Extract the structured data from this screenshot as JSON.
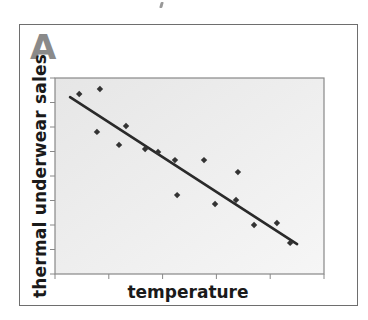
{
  "figure": {
    "panel_label": "A",
    "colors": {
      "frame": "#6e6e6e",
      "plot_bg": "#ececec",
      "axis": "#888888",
      "points": "#333333",
      "trendline": "#2a2a2a",
      "panel_label": "#8a8a8a"
    }
  },
  "chart_data": {
    "type": "scatter",
    "title": "",
    "xlabel": "temperature",
    "ylabel": "thermal underwear sales",
    "xlim": [
      0,
      10
    ],
    "ylim": [
      0,
      8
    ],
    "x_ticks": [
      0,
      2,
      4,
      6,
      8,
      10
    ],
    "y_ticks": [
      0,
      1,
      2,
      3,
      4,
      5,
      6,
      7,
      8
    ],
    "tick_labels_shown": false,
    "grid": false,
    "legend": null,
    "series": [
      {
        "name": "observations",
        "type": "scatter",
        "marker": "diamond",
        "points": [
          {
            "x": 0.9,
            "y": 7.35
          },
          {
            "x": 1.67,
            "y": 7.55
          },
          {
            "x": 1.56,
            "y": 5.8
          },
          {
            "x": 2.64,
            "y": 6.04
          },
          {
            "x": 2.38,
            "y": 5.27
          },
          {
            "x": 3.35,
            "y": 5.1
          },
          {
            "x": 3.83,
            "y": 4.98
          },
          {
            "x": 4.46,
            "y": 4.65
          },
          {
            "x": 4.54,
            "y": 3.22
          },
          {
            "x": 5.54,
            "y": 4.65
          },
          {
            "x": 5.95,
            "y": 2.86
          },
          {
            "x": 6.8,
            "y": 4.16
          },
          {
            "x": 6.73,
            "y": 3.02
          },
          {
            "x": 7.4,
            "y": 2.0
          },
          {
            "x": 8.25,
            "y": 2.08
          },
          {
            "x": 8.74,
            "y": 1.27
          }
        ]
      },
      {
        "name": "trend line",
        "type": "line",
        "points": [
          {
            "x": 0.56,
            "y": 7.22
          },
          {
            "x": 9.0,
            "y": 1.22
          }
        ]
      }
    ],
    "annotations": [
      "A"
    ]
  }
}
